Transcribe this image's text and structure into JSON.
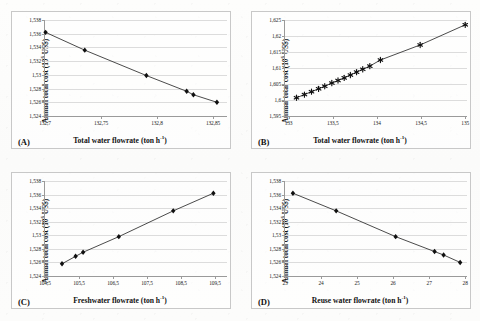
{
  "figure": {
    "decimal_separator": ",",
    "line_color": "#2b2b2b",
    "marker_color": "#101010",
    "gridline_color": "#dcdcdc",
    "axis_color": "#9a9a9a"
  },
  "panels": [
    {
      "tag": "(A)",
      "ylabel_main": "Annual total cost (10",
      "ylabel_sup": "6",
      "ylabel_tail": " US$)",
      "xlabel_main": "Total water flowrate (ton h",
      "xlabel_sup": "-1",
      "xlabel_tail": ")",
      "marker": "diamond",
      "yticks": [
        "1,524",
        "1,526",
        "1,528",
        "1,53",
        "1,532",
        "1,534",
        "1,536",
        "1,538"
      ],
      "xticks": [
        "132,7",
        "132,75",
        "132,8",
        "132,85"
      ],
      "chart_data": {
        "type": "scatter",
        "title": "",
        "xlabel": "Total water flowrate (ton h-1)",
        "ylabel": "Annual total cost (10^6 US$)",
        "xlim": [
          132.7,
          132.8625
        ],
        "ylim": [
          1.524,
          1.538
        ],
        "xtick_values": [
          132.7,
          132.75,
          132.8,
          132.85
        ],
        "ytick_values": [
          1.524,
          1.526,
          1.528,
          1.53,
          1.532,
          1.534,
          1.536,
          1.538
        ],
        "grid": true,
        "legend": "none",
        "x": [
          132.7005,
          132.7355,
          132.7905,
          132.8265,
          132.8325,
          132.8535
        ],
        "y": [
          1.5362,
          1.5336,
          1.5299,
          1.5276,
          1.5271,
          1.526
        ]
      }
    },
    {
      "tag": "(B)",
      "ylabel_main": "Annual total cost (10",
      "ylabel_sup": "6",
      "ylabel_tail": " US$)",
      "xlabel_main": "Total water flowrate (ton h",
      "xlabel_sup": "-1",
      "xlabel_tail": ")",
      "marker": "star",
      "yticks": [
        "1,595",
        "1,6",
        "1,605",
        "1,61",
        "1,615",
        "1,62",
        "1,625"
      ],
      "xticks": [
        "133",
        "133,5",
        "134",
        "134,5",
        "135"
      ],
      "chart_data": {
        "type": "scatter",
        "title": "",
        "xlabel": "Total water flowrate (ton h-1)",
        "ylabel": "Annual total cost (10^6 US$)",
        "xlim": [
          132.96,
          135.02
        ],
        "ylim": [
          1.595,
          1.625
        ],
        "xtick_values": [
          133,
          133.5,
          134,
          134.5,
          135
        ],
        "ytick_values": [
          1.595,
          1.6,
          1.605,
          1.61,
          1.615,
          1.62,
          1.625
        ],
        "grid": true,
        "legend": "none",
        "x": [
          133.09,
          133.18,
          133.26,
          133.34,
          133.41,
          133.49,
          133.56,
          133.63,
          133.7,
          133.77,
          133.84,
          133.92,
          134.04,
          134.49,
          135.0
        ],
        "y": [
          1.6007,
          1.6017,
          1.6026,
          1.6035,
          1.6043,
          1.6053,
          1.6061,
          1.6069,
          1.6078,
          1.6087,
          1.6096,
          1.6106,
          1.6125,
          1.6172,
          1.6235
        ]
      }
    },
    {
      "tag": "(C)",
      "ylabel_main": "Annual total cost (10",
      "ylabel_sup": "6",
      "ylabel_tail": " US$)",
      "xlabel_main": "Freshwater flowrate (ton h",
      "xlabel_sup": "-1",
      "xlabel_tail": ")",
      "marker": "diamond",
      "yticks": [
        "1,524",
        "1,526",
        "1,528",
        "1,53",
        "1,532",
        "1,534",
        "1,536",
        "1,538"
      ],
      "xticks": [
        "104,5",
        "105,5",
        "106,5",
        "107,5",
        "108,5",
        "109,5"
      ],
      "chart_data": {
        "type": "scatter",
        "title": "",
        "xlabel": "Freshwater flowrate (ton h-1)",
        "ylabel": "Annual total cost (10^6 US$)",
        "xlim": [
          104.5,
          109.85
        ],
        "ylim": [
          1.524,
          1.538
        ],
        "xtick_values": [
          104.5,
          105.5,
          106.5,
          107.5,
          108.5,
          109.5
        ],
        "ytick_values": [
          1.524,
          1.526,
          1.528,
          1.53,
          1.532,
          1.534,
          1.536,
          1.538
        ],
        "grid": true,
        "legend": "none",
        "x": [
          105.0,
          105.4,
          105.62,
          106.67,
          108.27,
          109.45
        ],
        "y": [
          1.5258,
          1.5269,
          1.5275,
          1.5298,
          1.5336,
          1.5362
        ]
      }
    },
    {
      "tag": "(D)",
      "ylabel_main": "Annual total cost (10",
      "ylabel_sup": "6",
      "ylabel_tail": " US$)",
      "xlabel_main": "Reuse water flowrate (ton h",
      "xlabel_sup": "-1",
      "xlabel_tail": ")",
      "marker": "diamond",
      "yticks": [
        "1,524",
        "1,526",
        "1,528",
        "1,53",
        "1,532",
        "1,534",
        "1,536",
        "1,538"
      ],
      "xticks": [
        "23",
        "24",
        "25",
        "26",
        "27",
        "28"
      ],
      "chart_data": {
        "type": "scatter",
        "title": "",
        "xlabel": "Reuse water flowrate (ton h-1)",
        "ylabel": "Annual total cost (10^6 US$)",
        "xlim": [
          23.0,
          28.05
        ],
        "ylim": [
          1.524,
          1.538
        ],
        "xtick_values": [
          23,
          24,
          25,
          26,
          27,
          28
        ],
        "ytick_values": [
          1.524,
          1.526,
          1.528,
          1.53,
          1.532,
          1.534,
          1.536,
          1.538
        ],
        "grid": true,
        "legend": "none",
        "x": [
          23.22,
          24.42,
          26.07,
          27.15,
          27.4,
          27.86
        ],
        "y": [
          1.5362,
          1.5336,
          1.5298,
          1.5276,
          1.5271,
          1.526
        ]
      }
    }
  ]
}
